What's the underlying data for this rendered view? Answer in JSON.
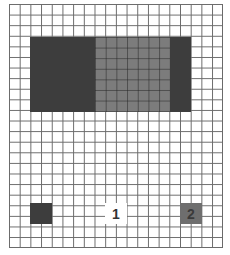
{
  "diagram": {
    "type": "grid",
    "columns": 20,
    "rows": 23,
    "colors": {
      "grid_line": "#6a6a6a",
      "dark": "#3d3d3d",
      "medium": "#7c7c7c",
      "background": "#ffffff"
    },
    "regions": [
      {
        "name": "dark-block-left",
        "shade": "dark",
        "col": 2,
        "row": 3,
        "width": 6,
        "height": 7
      },
      {
        "name": "medium-block-center",
        "shade": "medium",
        "col": 8,
        "row": 3,
        "width": 7,
        "height": 7
      },
      {
        "name": "dark-block-right",
        "shade": "dark",
        "col": 15,
        "row": 3,
        "width": 2,
        "height": 7
      },
      {
        "name": "small-square-left",
        "shade": "dark",
        "col": 2,
        "row": 19,
        "width": 2,
        "height": 2
      },
      {
        "name": "label-1",
        "shade": "white",
        "col": 9,
        "row": 19,
        "width": 2,
        "height": 2
      },
      {
        "name": "square-2",
        "shade": "medium",
        "col": 16,
        "row": 19,
        "width": 2,
        "height": 2
      }
    ],
    "labels": {
      "one": "1",
      "two": "2"
    }
  }
}
